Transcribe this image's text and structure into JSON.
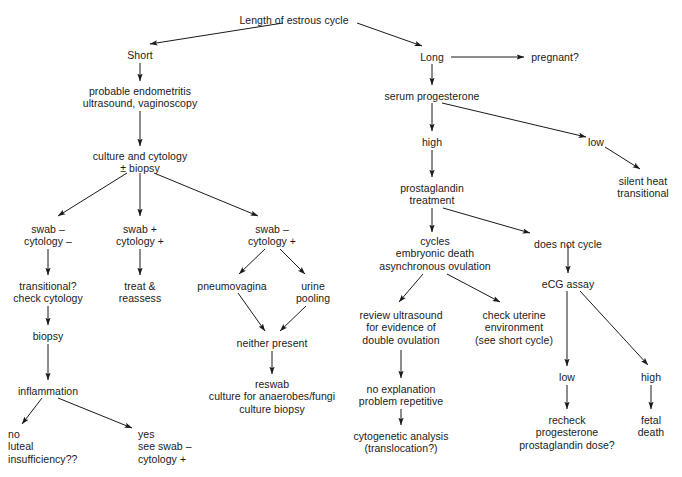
{
  "diagram": {
    "canvas": {
      "width": 682,
      "height": 477,
      "background": "#ffffff",
      "ink": "#1a1a1a"
    },
    "nodes": [
      {
        "id": "root",
        "text": "Length of estrous cycle",
        "x": 294,
        "y": 14,
        "align": "center"
      },
      {
        "id": "short",
        "text": "Short",
        "x": 140,
        "y": 49,
        "align": "center"
      },
      {
        "id": "long",
        "text": "Long",
        "x": 432,
        "y": 51,
        "align": "center"
      },
      {
        "id": "pregnant",
        "text": "pregnant?",
        "x": 555,
        "y": 51,
        "align": "center"
      },
      {
        "id": "endometritis",
        "text": "probable endometritis\nultrasound, vaginoscopy",
        "x": 140,
        "y": 85,
        "align": "center"
      },
      {
        "id": "serum_prog",
        "text": "serum progesterone",
        "x": 432,
        "y": 90,
        "align": "center"
      },
      {
        "id": "high",
        "text": "high",
        "x": 432,
        "y": 136,
        "align": "center"
      },
      {
        "id": "low_prog",
        "text": "low",
        "x": 596,
        "y": 136,
        "align": "center"
      },
      {
        "id": "culture_cytology",
        "text": "culture and cytology\n± biopsy",
        "x": 140,
        "y": 150,
        "align": "center"
      },
      {
        "id": "silent_heat",
        "text": "silent heat\ntransitional",
        "x": 643,
        "y": 175,
        "align": "center"
      },
      {
        "id": "prostaglandin",
        "text": "prostaglandin\ntreatment",
        "x": 432,
        "y": 182,
        "align": "center"
      },
      {
        "id": "swab_neg_cyt_neg",
        "text": "swab –\ncytology –",
        "x": 48,
        "y": 223,
        "align": "center"
      },
      {
        "id": "swab_pos_cyt_pos",
        "text": "swab +\ncytology +",
        "x": 140,
        "y": 223,
        "align": "center"
      },
      {
        "id": "swab_neg_cyt_pos",
        "text": "swab –\ncytology +",
        "x": 272,
        "y": 223,
        "align": "center"
      },
      {
        "id": "cycles",
        "text": "cycles\nembryonic death\nasynchronous ovulation",
        "x": 435,
        "y": 235,
        "align": "center"
      },
      {
        "id": "does_not_cycle",
        "text": "does not cycle",
        "x": 568,
        "y": 238,
        "align": "center"
      },
      {
        "id": "ecg_assay",
        "text": "eCG assay",
        "x": 568,
        "y": 278,
        "align": "center"
      },
      {
        "id": "transitional",
        "text": "transitional?\ncheck cytology",
        "x": 48,
        "y": 280,
        "align": "center"
      },
      {
        "id": "treat_reassess",
        "text": "treat &\nreassess",
        "x": 140,
        "y": 280,
        "align": "center"
      },
      {
        "id": "pneumovagina",
        "text": "pneumovagina",
        "x": 232,
        "y": 280,
        "align": "center"
      },
      {
        "id": "urine_pooling",
        "text": "urine\npooling",
        "x": 313,
        "y": 280,
        "align": "center"
      },
      {
        "id": "biopsy",
        "text": "biopsy",
        "x": 48,
        "y": 330,
        "align": "center"
      },
      {
        "id": "neither_present",
        "text": "neither present",
        "x": 272,
        "y": 337,
        "align": "center"
      },
      {
        "id": "review_us",
        "text": "review ultrasound\nfor evidence of\ndouble ovulation",
        "x": 401,
        "y": 309,
        "align": "center"
      },
      {
        "id": "check_uterine",
        "text": "check uterine\nenvironment\n(see short cycle)",
        "x": 514,
        "y": 309,
        "align": "center"
      },
      {
        "id": "low_ecg",
        "text": "low",
        "x": 567,
        "y": 371,
        "align": "center"
      },
      {
        "id": "high_ecg",
        "text": "high",
        "x": 651,
        "y": 371,
        "align": "center"
      },
      {
        "id": "inflammation",
        "text": "inflammation",
        "x": 48,
        "y": 385,
        "align": "center"
      },
      {
        "id": "no_explanation",
        "text": "no explanation\nproblem repetitive",
        "x": 401,
        "y": 383,
        "align": "center"
      },
      {
        "id": "reswab",
        "text": "reswab\nculture for anaerobes/fungi\nculture biopsy",
        "x": 272,
        "y": 378,
        "align": "center"
      },
      {
        "id": "recheck",
        "text": "recheck\nprogesterone\nprostaglandin dose?",
        "x": 567,
        "y": 414,
        "align": "center"
      },
      {
        "id": "fetal_death",
        "text": "fetal\ndeath",
        "x": 651,
        "y": 414,
        "align": "center"
      },
      {
        "id": "no_luteal",
        "text": "no\nluteal\ninsufficiency??",
        "x": 8,
        "y": 428,
        "align": "left"
      },
      {
        "id": "cytogenetic",
        "text": "cytogenetic analysis\n(translocation?)",
        "x": 401,
        "y": 430,
        "align": "center"
      },
      {
        "id": "yes_see_swab",
        "text": "yes\nsee swab –\ncytology +",
        "x": 138,
        "y": 428,
        "align": "left"
      }
    ],
    "edges": [
      {
        "from": "root",
        "to": "short",
        "x1": 283,
        "y1": 23,
        "x2": 150,
        "y2": 44,
        "arrow": true
      },
      {
        "from": "root",
        "to": "long",
        "x1": 357,
        "y1": 23,
        "x2": 422,
        "y2": 46,
        "arrow": true
      },
      {
        "from": "long",
        "to": "pregnant",
        "x1": 451,
        "y1": 57,
        "x2": 524,
        "y2": 57,
        "arrow": true
      },
      {
        "from": "short",
        "to": "endometritis",
        "x1": 140,
        "y1": 63,
        "x2": 140,
        "y2": 81,
        "arrow": true
      },
      {
        "from": "long",
        "to": "serum_prog",
        "x1": 432,
        "y1": 64,
        "x2": 432,
        "y2": 85,
        "arrow": true
      },
      {
        "from": "endometritis",
        "to": "culture_cytology",
        "x1": 140,
        "y1": 111,
        "x2": 140,
        "y2": 146,
        "arrow": true
      },
      {
        "from": "serum_prog",
        "to": "high",
        "x1": 432,
        "y1": 103,
        "x2": 432,
        "y2": 131,
        "arrow": true
      },
      {
        "from": "serum_prog",
        "to": "low_prog",
        "x1": 442,
        "y1": 103,
        "x2": 586,
        "y2": 137,
        "arrow": true
      },
      {
        "from": "low_prog",
        "to": "silent_heat",
        "x1": 605,
        "y1": 147,
        "x2": 640,
        "y2": 169,
        "arrow": true
      },
      {
        "from": "high",
        "to": "prostaglandin",
        "x1": 432,
        "y1": 150,
        "x2": 432,
        "y2": 177,
        "arrow": true
      },
      {
        "from": "culture_cytology",
        "to": "swab_neg_cyt_neg",
        "x1": 127,
        "y1": 173,
        "x2": 58,
        "y2": 216,
        "arrow": true
      },
      {
        "from": "culture_cytology",
        "to": "swab_pos_cyt_pos",
        "x1": 140,
        "y1": 173,
        "x2": 140,
        "y2": 216,
        "arrow": true
      },
      {
        "from": "culture_cytology",
        "to": "swab_neg_cyt_pos",
        "x1": 154,
        "y1": 173,
        "x2": 258,
        "y2": 216,
        "arrow": true
      },
      {
        "from": "prostaglandin",
        "to": "cycles",
        "x1": 432,
        "y1": 208,
        "x2": 432,
        "y2": 232,
        "arrow": true
      },
      {
        "from": "prostaglandin",
        "to": "does_not_cycle",
        "x1": 443,
        "y1": 208,
        "x2": 530,
        "y2": 233,
        "arrow": true
      },
      {
        "from": "swab_neg_cyt_neg",
        "to": "transitional",
        "x1": 48,
        "y1": 249,
        "x2": 48,
        "y2": 275,
        "arrow": true
      },
      {
        "from": "swab_pos_cyt_pos",
        "to": "treat_reassess",
        "x1": 140,
        "y1": 249,
        "x2": 140,
        "y2": 275,
        "arrow": true
      },
      {
        "from": "swab_neg_cyt_pos",
        "to": "pneumovagina",
        "x1": 265,
        "y1": 249,
        "x2": 239,
        "y2": 274,
        "arrow": true
      },
      {
        "from": "swab_neg_cyt_pos",
        "to": "urine_pooling",
        "x1": 280,
        "y1": 249,
        "x2": 305,
        "y2": 274,
        "arrow": true
      },
      {
        "from": "does_not_cycle",
        "to": "ecg_assay",
        "x1": 568,
        "y1": 245,
        "x2": 568,
        "y2": 273,
        "arrow": true
      },
      {
        "from": "cycles",
        "to": "review_us",
        "x1": 423,
        "y1": 274,
        "x2": 399,
        "y2": 302,
        "arrow": true
      },
      {
        "from": "cycles",
        "to": "check_uterine",
        "x1": 447,
        "y1": 274,
        "x2": 500,
        "y2": 302,
        "arrow": true
      },
      {
        "from": "ecg_assay",
        "to": "low_ecg",
        "x1": 567,
        "y1": 291,
        "x2": 567,
        "y2": 366,
        "arrow": true
      },
      {
        "from": "ecg_assay",
        "to": "high_ecg",
        "x1": 580,
        "y1": 291,
        "x2": 648,
        "y2": 365,
        "arrow": true
      },
      {
        "from": "transitional",
        "to": "biopsy",
        "x1": 48,
        "y1": 306,
        "x2": 48,
        "y2": 325,
        "arrow": true
      },
      {
        "from": "pneumovagina",
        "to": "neither_present",
        "x1": 238,
        "y1": 293,
        "x2": 265,
        "y2": 331,
        "arrow": true
      },
      {
        "from": "urine_pooling",
        "to": "neither_present",
        "x1": 306,
        "y1": 306,
        "x2": 280,
        "y2": 331,
        "arrow": true
      },
      {
        "from": "review_us",
        "to": "no_explanation",
        "x1": 401,
        "y1": 350,
        "x2": 401,
        "y2": 378,
        "arrow": true
      },
      {
        "from": "biopsy",
        "to": "inflammation",
        "x1": 48,
        "y1": 344,
        "x2": 48,
        "y2": 380,
        "arrow": true
      },
      {
        "from": "neither_present",
        "to": "reswab",
        "x1": 272,
        "y1": 351,
        "x2": 272,
        "y2": 374,
        "arrow": true
      },
      {
        "from": "low_ecg",
        "to": "recheck",
        "x1": 567,
        "y1": 385,
        "x2": 567,
        "y2": 409,
        "arrow": true
      },
      {
        "from": "high_ecg",
        "to": "fetal_death",
        "x1": 651,
        "y1": 385,
        "x2": 651,
        "y2": 409,
        "arrow": true
      },
      {
        "from": "inflammation",
        "to": "no_luteal",
        "x1": 42,
        "y1": 398,
        "x2": 22,
        "y2": 424,
        "arrow": true
      },
      {
        "from": "inflammation",
        "to": "yes_see_swab",
        "x1": 58,
        "y1": 398,
        "x2": 132,
        "y2": 428,
        "arrow": true
      },
      {
        "from": "no_explanation",
        "to": "cytogenetic",
        "x1": 401,
        "y1": 409,
        "x2": 401,
        "y2": 425,
        "arrow": true
      }
    ]
  }
}
